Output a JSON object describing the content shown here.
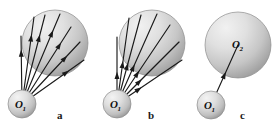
{
  "figure": {
    "type": "diagram",
    "kind": "physics-sphere-ray-diagram",
    "width": 279,
    "height": 132,
    "background_color": "#ffffff",
    "stroke_color": "#1a1a1a",
    "sphere_fill_light": "#e8e8e8",
    "sphere_fill_dark": "#9a9a9a",
    "sphere_edge_color": "#8c8c8c"
  },
  "panels": [
    {
      "id": "a",
      "caption": "a",
      "caption_x": 57,
      "caption_y": 119,
      "source": {
        "label_main": "O",
        "label_sub": "1",
        "cx": 22,
        "cy": 104,
        "r": 14
      },
      "target": {
        "label_main": "",
        "label_sub": "",
        "cx": 55,
        "cy": 43,
        "r": 33
      },
      "ray_count": 7,
      "arrowhead_placement": "outer",
      "rays": [
        {
          "x2": 21,
          "y2": 36,
          "head_t": 0.8
        },
        {
          "x2": 34,
          "y2": 17,
          "head_t": 0.8
        },
        {
          "x2": 45,
          "y2": 15,
          "head_t": 0.78
        },
        {
          "x2": 60,
          "y2": 14,
          "head_t": 0.82
        },
        {
          "x2": 71,
          "y2": 27,
          "head_t": 0.8
        },
        {
          "x2": 80,
          "y2": 42,
          "head_t": 0.78
        },
        {
          "x2": 84,
          "y2": 60,
          "head_t": 0.76
        }
      ]
    },
    {
      "id": "b",
      "caption": "b",
      "caption_x": 148,
      "caption_y": 119,
      "source": {
        "label_main": "O",
        "label_sub": "1",
        "cx": 117,
        "cy": 104,
        "r": 14
      },
      "target": {
        "label_main": "",
        "label_sub": "",
        "cx": 152,
        "cy": 43,
        "r": 33
      },
      "ray_count": 7,
      "arrowhead_placement": "inner",
      "rays": [
        {
          "x2": 117,
          "y2": 37,
          "head_t": 0.48
        },
        {
          "x2": 129,
          "y2": 18,
          "head_t": 0.5
        },
        {
          "x2": 141,
          "y2": 15,
          "head_t": 0.46
        },
        {
          "x2": 157,
          "y2": 14,
          "head_t": 0.44
        },
        {
          "x2": 170,
          "y2": 25,
          "head_t": 0.42
        },
        {
          "x2": 179,
          "y2": 42,
          "head_t": 0.4
        },
        {
          "x2": 182,
          "y2": 60,
          "head_t": 0.38
        }
      ]
    },
    {
      "id": "c",
      "caption": "c",
      "caption_x": 240,
      "caption_y": 119,
      "source": {
        "label_main": "O",
        "label_sub": "1",
        "cx": 211,
        "cy": 105,
        "r": 14
      },
      "target": {
        "label_main": "O",
        "label_sub": "2",
        "cx": 238,
        "cy": 45,
        "r": 33
      },
      "ray_count": 1,
      "arrowhead_placement": "mid",
      "rays": [
        {
          "x2": 238,
          "y2": 45,
          "head_t": 0.55
        }
      ]
    }
  ]
}
